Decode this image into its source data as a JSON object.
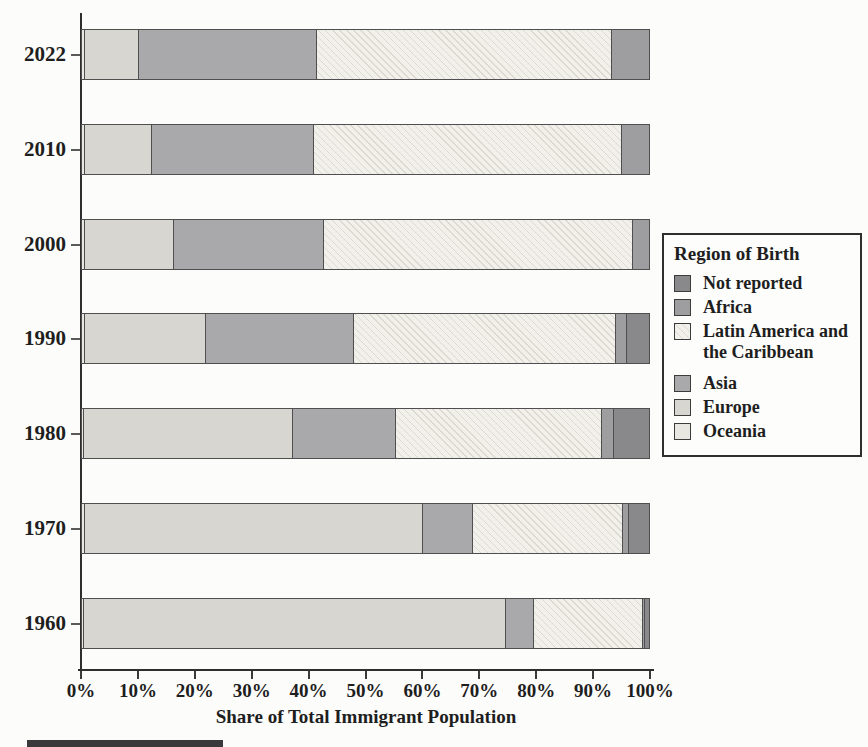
{
  "figure": {
    "xlabel": "Share of Total Immigrant Population",
    "legend": {
      "title": "Region of Birth",
      "items": [
        {
          "key": "not_reported",
          "label": "Not reported"
        },
        {
          "key": "africa",
          "label": "Africa"
        },
        {
          "key": "latam",
          "label": "Latin America and the Caribbean"
        },
        {
          "key": "asia",
          "label": "Asia"
        },
        {
          "key": "europe",
          "label": "Europe"
        },
        {
          "key": "oceania",
          "label": "Oceania"
        }
      ]
    },
    "colors": {
      "not_reported": "#89898c",
      "africa": "#9e9ea0",
      "latam": "#f1f0ea",
      "asia": "#a9a9ab",
      "europe": "#d7d6d1",
      "oceania": "#e8e7e2",
      "axis": "#2e2e2e",
      "bar_border": "#4f4f4f"
    }
  },
  "chart_data": {
    "type": "bar",
    "orientation": "horizontal",
    "stacked": true,
    "title": "",
    "xlabel": "Share of Total Immigrant Population",
    "legend_title": "Region of Birth",
    "legend_order_top_to_bottom": [
      "Not reported",
      "Africa",
      "Latin America and the Caribbean",
      "Asia",
      "Europe",
      "Oceania"
    ],
    "categories": [
      "2022",
      "2010",
      "2000",
      "1990",
      "1980",
      "1970",
      "1960"
    ],
    "x_tick_labels": [
      "0%",
      "10%",
      "20%",
      "30%",
      "40%",
      "50%",
      "60%",
      "70%",
      "80%",
      "90%",
      "100%"
    ],
    "xlim": [
      0,
      100
    ],
    "units": "percent of total immigrant population",
    "stack_order_left_to_right": [
      "Oceania",
      "Europe",
      "Asia",
      "Latin America and the Caribbean",
      "Africa",
      "Not reported"
    ],
    "series": [
      {
        "name": "Oceania",
        "key": "oceania",
        "values": [
          0.5,
          0.5,
          0.5,
          0.5,
          0.4,
          0.5,
          0.4
        ]
      },
      {
        "name": "Europe",
        "key": "europe",
        "values": [
          9.6,
          11.8,
          15.7,
          21.3,
          36.9,
          59.6,
          74.4
        ]
      },
      {
        "name": "Asia",
        "key": "asia",
        "values": [
          31.4,
          28.7,
          26.5,
          26.1,
          18.1,
          8.8,
          4.9
        ]
      },
      {
        "name": "Latin America and the Caribbean",
        "key": "latam",
        "hatch": true,
        "values": [
          52.0,
          54.3,
          54.5,
          46.3,
          36.4,
          26.6,
          19.2
        ]
      },
      {
        "name": "Africa",
        "key": "africa",
        "values": [
          6.5,
          4.7,
          2.8,
          2.0,
          2.0,
          1.0,
          0.4
        ]
      },
      {
        "name": "Not reported",
        "key": "not_reported",
        "values": [
          0,
          0,
          0,
          3.8,
          6.2,
          3.5,
          0.7
        ]
      }
    ]
  }
}
